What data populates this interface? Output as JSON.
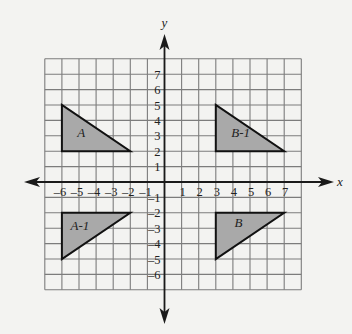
{
  "diagram": {
    "type": "coordinate-plane-transformations",
    "background_color": "#f3f3f1",
    "grid_color": "#7c7c7c",
    "axis_color": "#1a1a1a",
    "fill_color": "#a9a9a9",
    "x_axis": {
      "label": "x",
      "min": -7,
      "max": 8,
      "tick_labels": [
        "-6",
        "-5",
        "-4",
        "-3",
        "-2",
        "-1",
        "1",
        "2",
        "3",
        "4",
        "5",
        "6",
        "7"
      ],
      "tick_values": [
        -6,
        -5,
        -4,
        -3,
        -2,
        -1,
        1,
        2,
        3,
        4,
        5,
        6,
        7
      ]
    },
    "y_axis": {
      "label": "y",
      "min": -7,
      "max": 8,
      "tick_labels": [
        "7",
        "6",
        "5",
        "4",
        "3",
        "2",
        "1",
        "-1",
        "-2",
        "-3",
        "-4",
        "-5",
        "-6"
      ],
      "tick_values": [
        7,
        6,
        5,
        4,
        3,
        2,
        1,
        -1,
        -2,
        -3,
        -4,
        -5,
        -6
      ]
    },
    "shapes": [
      {
        "label": "A",
        "vertices": [
          [
            -6,
            5
          ],
          [
            -6,
            2
          ],
          [
            -2,
            2
          ]
        ],
        "label_pos": [
          -5.1,
          2.9
        ]
      },
      {
        "label": "B-1",
        "vertices": [
          [
            3,
            5
          ],
          [
            3,
            2
          ],
          [
            7,
            2
          ]
        ],
        "label_pos": [
          3.9,
          2.9
        ]
      },
      {
        "label": "A-1",
        "vertices": [
          [
            -6,
            -2
          ],
          [
            -2,
            -2
          ],
          [
            -6,
            -5
          ]
        ],
        "label_pos": [
          -5.5,
          -3.1
        ]
      },
      {
        "label": "B",
        "vertices": [
          [
            3,
            -2
          ],
          [
            7,
            -2
          ],
          [
            3,
            -5
          ]
        ],
        "label_pos": [
          4.1,
          -2.9
        ]
      }
    ]
  },
  "text": {
    "x_axis_label": "x",
    "y_axis_label": "y",
    "shape_A": "A",
    "shape_B1": "B-1",
    "shape_A1": "A-1",
    "shape_B": "B"
  }
}
